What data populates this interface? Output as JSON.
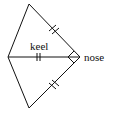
{
  "diagram": {
    "type": "geometry",
    "shape": "kite/dart figure",
    "labels": {
      "keel": "keel",
      "nose": "nose"
    },
    "vertices": {
      "top": [
        29,
        4
      ],
      "left": [
        8,
        57
      ],
      "nose": [
        80,
        57
      ],
      "bottom": [
        29,
        108
      ]
    },
    "markings": {
      "congruent_ticks": [
        "top-nose edge",
        "keel (left-nose)",
        "bottom-nose edge"
      ],
      "tick_style": "double",
      "nose_angle_mark": "small diamond/right-angle mark"
    },
    "colors": {
      "stroke": "#111111",
      "background": "#ffffff"
    }
  }
}
